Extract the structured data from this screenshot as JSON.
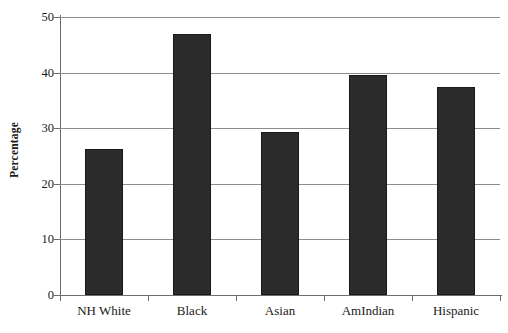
{
  "chart_data": {
    "type": "bar",
    "title": "",
    "title_cropped": true,
    "xlabel": "",
    "ylabel": "Percentage",
    "ylim": [
      0,
      50
    ],
    "yticks": [
      0,
      10,
      20,
      30,
      40,
      50
    ],
    "ytick_labels": [
      "0",
      "10",
      "20",
      "30",
      "40",
      "50"
    ],
    "grid": true,
    "legend": "none",
    "categories": [
      "NH White",
      "Black",
      "Asian",
      "AmIndian",
      "Hispanic"
    ],
    "values": [
      26.3,
      47.0,
      29.3,
      39.5,
      37.4
    ],
    "bar_color": "#2b2b2b",
    "bar_edge_color": "#1a1a1a",
    "axis_color": "#6d6d6d",
    "grid_color": "#8d8d8d",
    "text_color": "#1a1a1a",
    "background": "#ffffff"
  },
  "axis": {
    "y_title": "Percentage"
  }
}
